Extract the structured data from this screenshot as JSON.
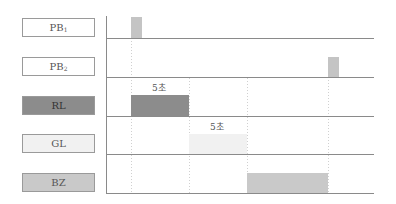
{
  "signals": [
    {
      "id": "pb1",
      "label": "PB",
      "sub": "1",
      "fill": "#ffffff"
    },
    {
      "id": "pb2",
      "label": "PB",
      "sub": "2",
      "fill": "#ffffff"
    },
    {
      "id": "rl",
      "label": "RL",
      "sub": "",
      "fill": "#8c8c8c"
    },
    {
      "id": "gl",
      "label": "GL",
      "sub": "",
      "fill": "#f1f1f1"
    },
    {
      "id": "bz",
      "label": "BZ",
      "sub": "",
      "fill": "#c9c9c9"
    }
  ],
  "annotations": {
    "rl_duration": "5초",
    "gl_duration": "5초"
  },
  "colors": {
    "pulse": "#c4c4c4",
    "rl_bar": "#8c8c8c",
    "gl_bar": "#f1f1f1",
    "bz_bar": "#c9c9c9",
    "line": "#8a8a8a",
    "guide": "#d0d0d0"
  }
}
